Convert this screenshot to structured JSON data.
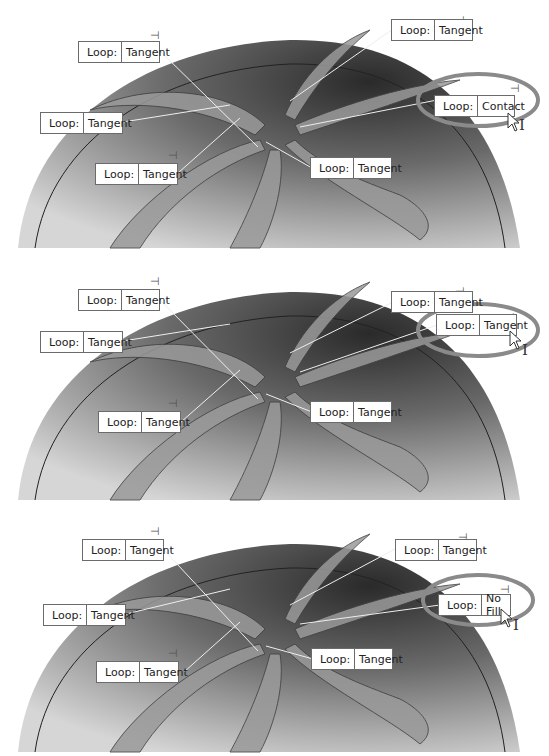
{
  "figure": {
    "panels": [
      {
        "id": "panel-1",
        "highlighted_callout": {
          "key": "Loop:",
          "value": "Contact"
        },
        "callouts": [
          {
            "key": "Loop:",
            "value": "Tangent"
          },
          {
            "key": "Loop:",
            "value": "Tangent"
          },
          {
            "key": "Loop:",
            "value": "Tangent"
          },
          {
            "key": "Loop:",
            "value": "Tangent"
          },
          {
            "key": "Loop:",
            "value": "Tangent"
          }
        ]
      },
      {
        "id": "panel-2",
        "highlighted_callout": {
          "key": "Loop:",
          "value": "Tangent"
        },
        "callouts": [
          {
            "key": "Loop:",
            "value": "Tangent"
          },
          {
            "key": "Loop:",
            "value": "Tangent"
          },
          {
            "key": "Loop:",
            "value": "Tangent"
          },
          {
            "key": "Loop:",
            "value": "Tangent"
          },
          {
            "key": "Loop:",
            "value": "Tangent"
          }
        ]
      },
      {
        "id": "panel-3",
        "highlighted_callout": {
          "key": "Loop:",
          "value": "No Fill"
        },
        "callouts": [
          {
            "key": "Loop:",
            "value": "Tangent"
          },
          {
            "key": "Loop:",
            "value": "Tangent"
          },
          {
            "key": "Loop:",
            "value": "Tangent"
          },
          {
            "key": "Loop:",
            "value": "Tangent"
          },
          {
            "key": "Loop:",
            "value": "Tangent"
          }
        ]
      }
    ],
    "colors": {
      "highlight_ring": "#8a8a8a",
      "callout_border": "#6b6b6b",
      "model_dark": "#3a3a3a",
      "model_light": "#d8d8d8"
    },
    "icons": {
      "pin": "pushpin-icon",
      "cursor": "arrow-cursor-icon",
      "ibeam": "ibeam-cursor-icon"
    },
    "glyphs": {
      "pin": "⊣",
      "ibeam": "I"
    }
  }
}
